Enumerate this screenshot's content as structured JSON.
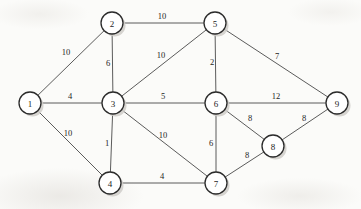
{
  "figure": {
    "background_color": "#fbfbf9",
    "node_fill": "#ffffff",
    "node_stroke": "#2b2b2b",
    "edge_stroke": "#5b5b5b",
    "shadow_color": "#cfcdc9"
  },
  "chart_data": {
    "type": "diagram",
    "graph_type": "undirected-weighted-graph",
    "title": "",
    "node_count": 9,
    "edge_count": 15,
    "nodes": [
      {
        "id": "1",
        "label": "1",
        "x": 30,
        "y": 103,
        "r": 11
      },
      {
        "id": "2",
        "label": "2",
        "x": 112,
        "y": 23,
        "r": 11
      },
      {
        "id": "3",
        "label": "3",
        "x": 113,
        "y": 103,
        "r": 11
      },
      {
        "id": "4",
        "label": "4",
        "x": 110,
        "y": 183,
        "r": 11
      },
      {
        "id": "5",
        "label": "5",
        "x": 215,
        "y": 23,
        "r": 11
      },
      {
        "id": "6",
        "label": "6",
        "x": 216,
        "y": 103,
        "r": 11
      },
      {
        "id": "7",
        "label": "7",
        "x": 216,
        "y": 183,
        "r": 11
      },
      {
        "id": "8",
        "label": "8",
        "x": 273,
        "y": 146,
        "r": 11
      },
      {
        "id": "9",
        "label": "9",
        "x": 337,
        "y": 103,
        "r": 11
      }
    ],
    "edges": [
      {
        "source": "1",
        "target": "2",
        "weight": "10",
        "lx": 66,
        "ly": 52
      },
      {
        "source": "1",
        "target": "3",
        "weight": "4",
        "lx": 70,
        "ly": 96
      },
      {
        "source": "1",
        "target": "4",
        "weight": "10",
        "lx": 68,
        "ly": 133
      },
      {
        "source": "2",
        "target": "3",
        "weight": "6",
        "lx": 108,
        "ly": 63
      },
      {
        "source": "2",
        "target": "5",
        "weight": "10",
        "lx": 162,
        "ly": 16
      },
      {
        "source": "3",
        "target": "5",
        "weight": "10",
        "lx": 161,
        "ly": 55
      },
      {
        "source": "3",
        "target": "6",
        "weight": "5",
        "lx": 163,
        "ly": 96
      },
      {
        "source": "3",
        "target": "4",
        "weight": "1",
        "lx": 107,
        "ly": 143
      },
      {
        "source": "3",
        "target": "7",
        "weight": "10",
        "lx": 163,
        "ly": 135
      },
      {
        "source": "4",
        "target": "7",
        "weight": "4",
        "lx": 162,
        "ly": 176
      },
      {
        "source": "5",
        "target": "6",
        "weight": "2",
        "lx": 212,
        "ly": 62
      },
      {
        "source": "5",
        "target": "9",
        "weight": "7",
        "lx": 277,
        "ly": 56
      },
      {
        "source": "6",
        "target": "9",
        "weight": "12",
        "lx": 276,
        "ly": 96
      },
      {
        "source": "6",
        "target": "7",
        "weight": "6",
        "lx": 211,
        "ly": 143
      },
      {
        "source": "6",
        "target": "8",
        "weight": "8",
        "lx": 250,
        "ly": 118
      },
      {
        "source": "7",
        "target": "8",
        "weight": "8",
        "lx": 247,
        "ly": 155
      },
      {
        "source": "8",
        "target": "9",
        "weight": "8",
        "lx": 304,
        "ly": 118
      }
    ]
  }
}
